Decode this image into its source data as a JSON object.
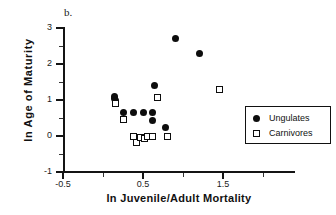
{
  "figure": {
    "panel_label": "b.",
    "background_color": "#ffffff",
    "foreground_color": "#111111"
  },
  "legend": {
    "position": "center-right",
    "entries": [
      {
        "label": "Ungulates",
        "marker": "filled-circle",
        "color": "#0d0d0d"
      },
      {
        "label": "Carnivores",
        "marker": "open-square",
        "color": "#0d0d0d"
      }
    ]
  },
  "axes": {
    "x": {
      "label": "ln Juvenile/Adult Mortality",
      "major_ticks": [
        -0.5,
        0.5,
        1.5
      ],
      "major_tick_labels": [
        "-0.5",
        "0.5",
        "1.5"
      ],
      "minor_ticks": [
        0.0,
        1.0,
        2.0
      ],
      "limits": [
        -0.5,
        2.4
      ]
    },
    "y": {
      "label": "ln Age of Maturity",
      "major_ticks": [
        -1,
        0,
        1,
        2,
        3
      ],
      "major_tick_labels": [
        "-1",
        "0",
        "1",
        "2",
        "3"
      ],
      "minor_ticks": [
        -0.5,
        0.5,
        1.5,
        2.5
      ],
      "limits": [
        -1,
        3
      ]
    }
  },
  "chart_data": {
    "type": "scatter",
    "title": "",
    "xlabel": "ln Juvenile/Adult Mortality",
    "ylabel": "ln Age of Maturity",
    "xlim": [
      -0.5,
      2.4
    ],
    "ylim": [
      -1,
      3
    ],
    "grid": false,
    "legend_position": "center-right",
    "annotations": [
      "b."
    ],
    "series": [
      {
        "name": "Ungulates",
        "marker": "filled-circle",
        "color": "#0d0d0d",
        "points": [
          [
            0.25,
            0.65
          ],
          [
            0.14,
            1.05
          ],
          [
            0.14,
            1.1
          ],
          [
            0.155,
            1.0
          ],
          [
            0.38,
            0.65
          ],
          [
            0.5,
            0.65
          ],
          [
            0.62,
            0.65
          ],
          [
            0.62,
            0.42
          ],
          [
            0.64,
            1.4
          ],
          [
            0.78,
            0.25
          ],
          [
            0.9,
            2.7
          ],
          [
            1.2,
            2.3
          ]
        ]
      },
      {
        "name": "Carnivores",
        "marker": "open-square",
        "color": "#0d0d0d",
        "points": [
          [
            0.15,
            0.9
          ],
          [
            0.26,
            0.47
          ],
          [
            0.38,
            -0.02
          ],
          [
            0.42,
            -0.18
          ],
          [
            0.47,
            -0.04
          ],
          [
            0.52,
            -0.08
          ],
          [
            0.56,
            -0.01
          ],
          [
            0.62,
            -0.01
          ],
          [
            0.68,
            1.07
          ],
          [
            0.8,
            -0.02
          ],
          [
            1.45,
            1.3
          ]
        ]
      }
    ]
  }
}
